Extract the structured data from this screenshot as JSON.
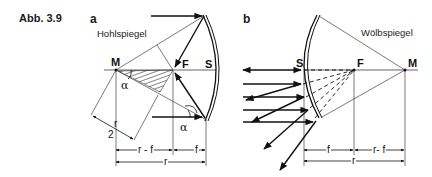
{
  "figure": {
    "caption": "Abb. 3.9",
    "panels": [
      {
        "label": "a",
        "title": "Hohlspiegel",
        "points": {
          "M": "M",
          "F": "F",
          "S": "S"
        },
        "angles": [
          "α",
          "α"
        ],
        "dimensions": {
          "r_minus_f": "r - f",
          "f": "f",
          "r": "r",
          "r_half_num": "r",
          "r_half_den": "2"
        }
      },
      {
        "label": "b",
        "title": "Wölbspiegel",
        "points": {
          "S": "S",
          "F": "F",
          "M": "M"
        },
        "dimensions": {
          "f": "f",
          "r_minus_f": "r- f",
          "r": "r"
        }
      }
    ]
  }
}
